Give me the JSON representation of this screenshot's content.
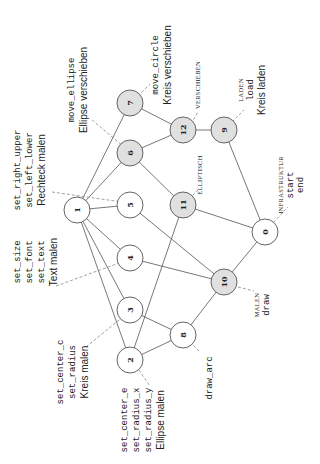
{
  "diagram": {
    "orientation": "rotated-90-ccw",
    "nodes": [
      {
        "id": "0",
        "label": "0",
        "x": 265,
        "y": 232,
        "fill": "white"
      },
      {
        "id": "1",
        "label": "1",
        "x": 77,
        "y": 210,
        "fill": "white"
      },
      {
        "id": "2",
        "label": "2",
        "x": 130,
        "y": 360,
        "fill": "white"
      },
      {
        "id": "3",
        "label": "3",
        "x": 130,
        "y": 310,
        "fill": "white"
      },
      {
        "id": "4",
        "label": "4",
        "x": 130,
        "y": 258,
        "fill": "white"
      },
      {
        "id": "5",
        "label": "5",
        "x": 130,
        "y": 205,
        "fill": "white"
      },
      {
        "id": "6",
        "label": "6",
        "x": 130,
        "y": 153,
        "fill": "gray"
      },
      {
        "id": "7",
        "label": "7",
        "x": 130,
        "y": 103,
        "fill": "gray"
      },
      {
        "id": "8",
        "label": "8",
        "x": 183,
        "y": 335,
        "fill": "white"
      },
      {
        "id": "9",
        "label": "9",
        "x": 224,
        "y": 130,
        "fill": "gray"
      },
      {
        "id": "10",
        "label": "10",
        "x": 224,
        "y": 282,
        "fill": "gray"
      },
      {
        "id": "11",
        "label": "11",
        "x": 183,
        "y": 205,
        "fill": "gray"
      },
      {
        "id": "12",
        "label": "12",
        "x": 183,
        "y": 130,
        "fill": "gray"
      }
    ],
    "edges": [
      [
        "1",
        "7"
      ],
      [
        "1",
        "6"
      ],
      [
        "1",
        "5"
      ],
      [
        "1",
        "4"
      ],
      [
        "1",
        "3"
      ],
      [
        "1",
        "2"
      ],
      [
        "7",
        "12"
      ],
      [
        "6",
        "12"
      ],
      [
        "6",
        "11"
      ],
      [
        "5",
        "10"
      ],
      [
        "4",
        "10"
      ],
      [
        "3",
        "8"
      ],
      [
        "2",
        "8"
      ],
      [
        "2",
        "11"
      ],
      [
        "8",
        "10"
      ],
      [
        "12",
        "9"
      ],
      [
        "9",
        "0"
      ],
      [
        "11",
        "0"
      ],
      [
        "10",
        "0"
      ]
    ],
    "annotations": {
      "rechteck": [
        "set_right_upper",
        "set_left_lower",
        "Rechteck malen"
      ],
      "text": [
        "set_size",
        "set_font",
        "set_text",
        "Text malen"
      ],
      "kreis": [
        "set_center_c",
        "set_radius",
        "Kreis malen"
      ],
      "ellipse": [
        "set_center_e",
        "set_radius_x",
        "set_radius_y",
        "Ellipse malen"
      ],
      "move_ellipse": [
        "move_ellipse",
        "Ellipse verschieben"
      ],
      "move_circle": [
        "move_circle",
        "Kreis verschieben"
      ],
      "verschieben": "VERSCHIEBEN",
      "laden": [
        "LADEN",
        "load",
        "Kreis laden"
      ],
      "infrastruktur": [
        "INFRASTRUKTUR",
        "start",
        "end"
      ],
      "elliptisch": "ELLIPTISCH",
      "malen": [
        "MALEN",
        "draw"
      ],
      "draw_arc": "draw_arc"
    }
  }
}
